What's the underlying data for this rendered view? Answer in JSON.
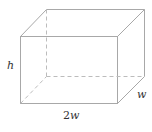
{
  "diagram": {
    "type": "rectangular-box",
    "labels": {
      "height": "h",
      "length_coef": "2",
      "length_var": "w",
      "width": "w"
    },
    "colors": {
      "edge": "#a8a8a8",
      "hidden_edge": "#bcbcbc",
      "label": "#333333",
      "background": "#ffffff"
    },
    "vertices": {
      "front_top_left": [
        20,
        36
      ],
      "front_top_right": [
        117,
        36
      ],
      "front_bottom_left": [
        20,
        103
      ],
      "front_bottom_right": [
        117,
        103
      ],
      "back_top_left": [
        46,
        9
      ],
      "back_top_right": [
        144,
        9
      ],
      "back_bottom_left": [
        46,
        76
      ],
      "back_bottom_right": [
        144,
        76
      ]
    }
  }
}
